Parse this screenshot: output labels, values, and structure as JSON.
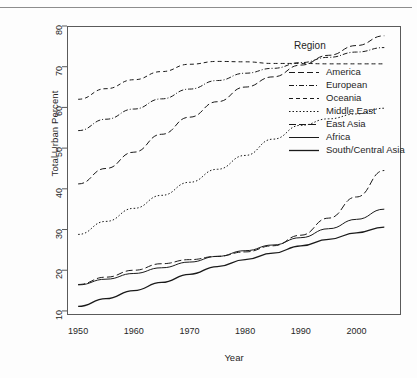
{
  "figure": {
    "ylabel": "Total Urban Percent",
    "xlabel": "Year",
    "legend_title": "Region"
  },
  "chart_data": {
    "type": "line",
    "title": "",
    "xlabel": "Year",
    "ylabel": "Total Urban Percent",
    "xlim": [
      1948,
      2008
    ],
    "ylim": [
      9,
      80
    ],
    "xticks": [
      1950,
      1960,
      1970,
      1980,
      1990,
      2000
    ],
    "yticks": [
      10,
      20,
      30,
      40,
      50,
      60,
      70,
      80
    ],
    "grid": false,
    "legend_position": "right-outside",
    "x": [
      1950,
      1955,
      1960,
      1965,
      1970,
      1975,
      1980,
      1985,
      1990,
      1995,
      2000,
      2005
    ],
    "series": [
      {
        "name": "America",
        "dash": "6,3",
        "width": 1.0,
        "values": [
          41.2,
          45.0,
          49.0,
          53.4,
          57.6,
          61.4,
          65.0,
          67.5,
          70.4,
          72.8,
          75.2,
          77.6
        ]
      },
      {
        "name": "European",
        "dash": "5,2,1,2",
        "width": 1.0,
        "values": [
          54.3,
          57.1,
          59.6,
          62.1,
          64.5,
          66.6,
          68.4,
          69.6,
          71.0,
          72.3,
          73.6,
          74.7
        ]
      },
      {
        "name": "Oceania",
        "dash": "4,3",
        "width": 1.0,
        "values": [
          62.0,
          64.6,
          66.8,
          68.8,
          70.6,
          71.3,
          71.2,
          70.8,
          70.8,
          70.7,
          70.7,
          70.7
        ]
      },
      {
        "name": "Middle East",
        "dash": "1.5,2",
        "width": 1.0,
        "values": [
          28.8,
          32.0,
          35.2,
          38.4,
          41.6,
          44.8,
          48.2,
          52.2,
          55.6,
          57.2,
          58.4,
          59.8
        ]
      },
      {
        "name": "East Asia",
        "dash": "7,3",
        "width": 1.0,
        "values": [
          16.5,
          18.3,
          20.0,
          21.6,
          22.6,
          23.4,
          24.5,
          26.0,
          28.6,
          32.8,
          38.0,
          44.5
        ]
      },
      {
        "name": "Africa",
        "dash": "none",
        "width": 1.0,
        "values": [
          16.4,
          17.8,
          19.2,
          20.6,
          22.0,
          23.4,
          24.8,
          26.2,
          28.0,
          30.2,
          32.5,
          35.0
        ]
      },
      {
        "name": "South/Central Asia",
        "dash": "none",
        "width": 1.3,
        "values": [
          11.1,
          13.0,
          15.0,
          17.0,
          19.0,
          20.9,
          22.6,
          24.2,
          26.0,
          27.6,
          29.2,
          30.6
        ]
      }
    ]
  }
}
